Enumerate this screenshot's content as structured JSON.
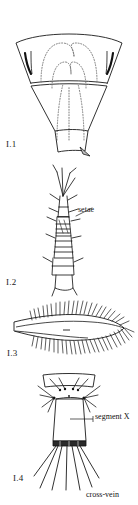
{
  "plate": {
    "title": "Entomological line-drawing plate",
    "background_color": "#ffffff",
    "ink_color": "#111111",
    "figures": [
      {
        "id": "I.1",
        "label": "I.1",
        "subject": "abdomen-segment-dorsal-view"
      },
      {
        "id": "I.2",
        "label": "I.2",
        "subject": "antenna-segmented"
      },
      {
        "id": "I.3",
        "label": "I.3",
        "subject": "fringed-wing"
      },
      {
        "id": "I.4",
        "label": "I.4",
        "subject": "terminal-abdominal-segment"
      }
    ],
    "annotations": [
      {
        "id": "setae",
        "label": "setae"
      },
      {
        "id": "segment_x",
        "label": "segment X"
      },
      {
        "id": "cross_vein",
        "label": "cross-vein"
      }
    ]
  }
}
